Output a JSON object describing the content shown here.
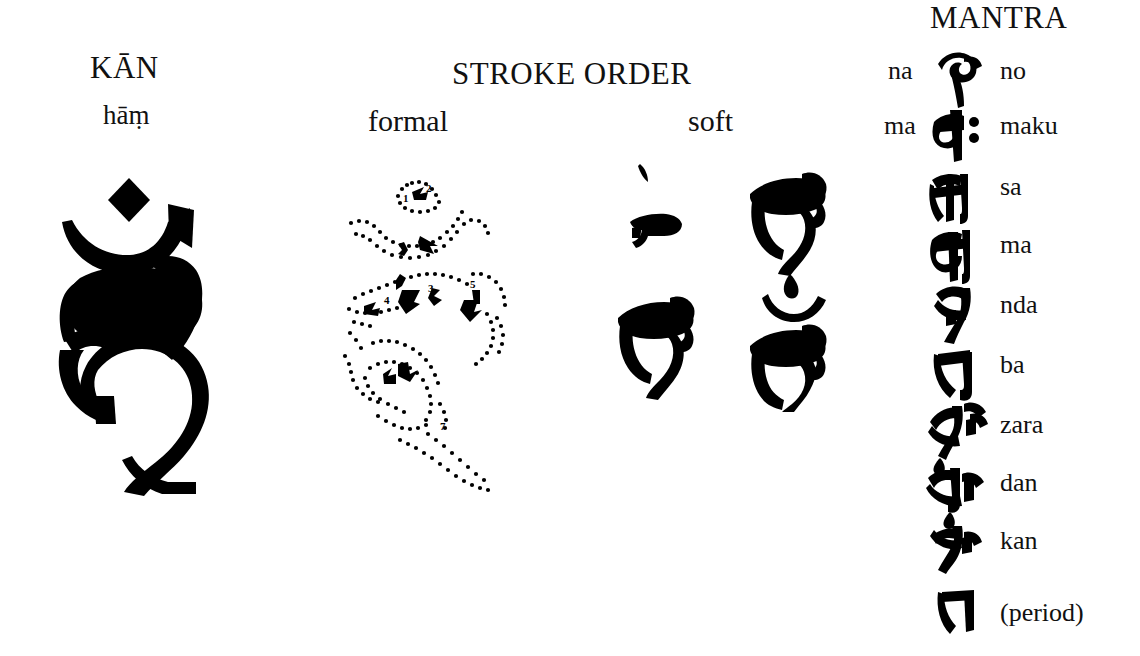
{
  "page": {
    "background_color": "#ffffff",
    "ink_color": "#000000"
  },
  "seed_syllable": {
    "section_name": "seed-syllable",
    "title": "KĀN",
    "romanization": "hāṃ",
    "glyph_name": "siddham-ham-large"
  },
  "stroke_order": {
    "title": "STROKE ORDER",
    "columns": [
      {
        "label": "formal",
        "name": "formal-stroke-diagram"
      },
      {
        "label": "soft",
        "name": "soft-stroke-stages"
      }
    ],
    "formal": {
      "description": "dotted outline of the full glyph with numbered directional arrows",
      "stroke_numbers": [
        "1",
        "2",
        "3",
        "4",
        "5",
        "6",
        "7"
      ]
    },
    "soft": {
      "stages": [
        {
          "index": "1",
          "name": "soft-stage-1"
        },
        {
          "index": "2",
          "name": "soft-stage-2"
        },
        {
          "index": "3",
          "name": "soft-stage-3"
        },
        {
          "index": "4",
          "name": "soft-stage-4"
        }
      ]
    }
  },
  "mantra": {
    "title": "MANTRA",
    "rows": [
      {
        "prefix": "na",
        "glyph": "siddham-no",
        "reading": "no"
      },
      {
        "prefix": "ma",
        "glyph": "siddham-maku",
        "reading": "maku"
      },
      {
        "prefix": "",
        "glyph": "siddham-sa",
        "reading": "sa"
      },
      {
        "prefix": "",
        "glyph": "siddham-ma",
        "reading": "ma"
      },
      {
        "prefix": "",
        "glyph": "siddham-nda",
        "reading": "nda"
      },
      {
        "prefix": "",
        "glyph": "siddham-ba",
        "reading": "ba"
      },
      {
        "prefix": "",
        "glyph": "siddham-zara",
        "reading": "zara"
      },
      {
        "prefix": "",
        "glyph": "siddham-dan",
        "reading": "dan"
      },
      {
        "prefix": "",
        "glyph": "siddham-kan",
        "reading": "kan"
      },
      {
        "prefix": "",
        "glyph": "siddham-period",
        "reading": "(period)"
      }
    ]
  }
}
